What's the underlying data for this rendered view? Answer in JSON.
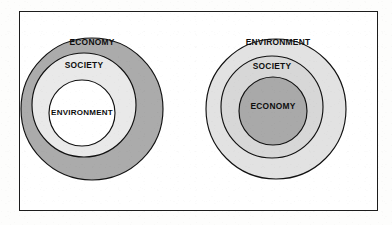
{
  "figure": {
    "name": "nested-circles-sustainability-models",
    "frame": {
      "border_color": "#1c1c1c",
      "background": "#ffffff"
    },
    "page_background": "#fdfdfc"
  },
  "diagrams": [
    {
      "id": "left",
      "name": "economy-outermost-model",
      "center": {
        "cx": 72,
        "cy": 97
      },
      "rings": [
        {
          "label": "ECONOMY",
          "level": "outer",
          "fill": "#ababab",
          "r": 71,
          "label_x": 72,
          "label_y": 31
        },
        {
          "label": "SOCIETY",
          "level": "middle",
          "fill": "#e9e9e9",
          "r": 52,
          "label_x": 64,
          "label_y": 54
        },
        {
          "label": "ENVIRONMENT",
          "level": "inner",
          "fill": "#ffffff",
          "r": 33,
          "label_x": 62,
          "label_y": 101
        }
      ]
    },
    {
      "id": "right",
      "name": "environment-outermost-model",
      "center": {
        "cx": 256,
        "cy": 97
      },
      "rings": [
        {
          "label": "ENVIRONMENT",
          "level": "outer",
          "fill": "#e2e2e2",
          "r": 70,
          "label_x": 258,
          "label_y": 31
        },
        {
          "label": "SOCIETY",
          "level": "middle",
          "fill": "#d7d7d7",
          "r": 51,
          "label_x": 252,
          "label_y": 55
        },
        {
          "label": "ECONOMY",
          "level": "inner",
          "fill": "#a9a9a9",
          "r": 34,
          "label_x": 253,
          "label_y": 95
        }
      ]
    }
  ],
  "colors": {
    "outline": "#111111",
    "text": "#0d0d0d",
    "dark_gray": "#a9a9a9",
    "mid_gray": "#ababab",
    "light_gray": "#e2e2e2",
    "lighter_gray": "#e9e9e9",
    "white": "#ffffff"
  }
}
